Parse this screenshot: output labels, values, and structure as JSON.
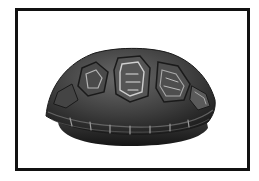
{
  "image": {
    "subject": "box turtle shell",
    "style": "grayscale photograph",
    "frame": {
      "border_color": "#111111",
      "background": "#ffffff"
    }
  },
  "colors": {
    "shell_dark": "#2a2a2a",
    "shell_mid": "#555555",
    "shell_light": "#9a9a9a",
    "shell_highlight": "#d0d0d0"
  }
}
